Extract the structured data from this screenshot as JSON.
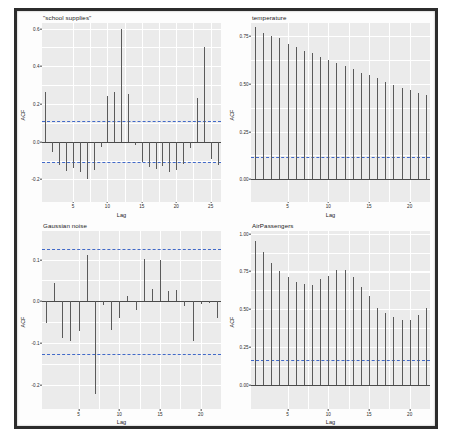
{
  "figure": {
    "layout": "2x2 grid of ACF panels",
    "shared_xlabel": "Lag",
    "shared_ylabel": "ACF",
    "panel_bg": "#ebebeb",
    "gridline_color": "#ffffff",
    "stem_color": "#5a5a5a",
    "ci_color": "#4169c8",
    "frame_color": "#2c2c2c"
  },
  "chart_data": [
    {
      "type": "bar",
      "title": "\"school supplies\"",
      "xlabel": "Lag",
      "ylabel": "ACF",
      "xlim": [
        0.5,
        26.5
      ],
      "ylim": [
        -0.32,
        0.63
      ],
      "yticks": [
        -0.2,
        0.0,
        0.2,
        0.4,
        0.6
      ],
      "ytick_labels": [
        "-0.2",
        "0.0",
        "0.2",
        "0.4",
        "0.6"
      ],
      "xticks": [
        5,
        10,
        15,
        20,
        25
      ],
      "xtick_labels": [
        "5",
        "10",
        "15",
        "20",
        "25"
      ],
      "ci_upper": 0.108,
      "ci_lower": -0.108,
      "grid": true,
      "x": [
        1,
        2,
        3,
        4,
        5,
        6,
        7,
        8,
        9,
        10,
        11,
        12,
        13,
        14,
        15,
        16,
        17,
        18,
        19,
        20,
        21,
        22,
        23,
        24,
        25,
        26
      ],
      "values": [
        0.265,
        -0.055,
        -0.122,
        -0.158,
        -0.14,
        -0.16,
        -0.196,
        -0.15,
        -0.028,
        0.245,
        0.265,
        0.6,
        0.252,
        -0.018,
        -0.11,
        -0.135,
        -0.145,
        -0.128,
        -0.16,
        -0.148,
        -0.12,
        -0.035,
        0.232,
        0.5,
        -0.09,
        -0.125
      ]
    },
    {
      "type": "bar",
      "title": "temperature",
      "xlabel": "Lag",
      "ylabel": "ACF",
      "xlim": [
        0.5,
        22.5
      ],
      "ylim": [
        -0.12,
        0.82
      ],
      "yticks": [
        0.0,
        0.25,
        0.5,
        0.75
      ],
      "ytick_labels": [
        "0.00",
        "0.25",
        "0.50",
        "0.75"
      ],
      "xticks": [
        5,
        10,
        15,
        20
      ],
      "xtick_labels": [
        "5",
        "10",
        "15",
        "20"
      ],
      "ci_upper": 0.118,
      "ci_lower": -0.118,
      "grid": true,
      "x": [
        1,
        2,
        3,
        4,
        5,
        6,
        7,
        8,
        9,
        10,
        11,
        12,
        13,
        14,
        15,
        16,
        17,
        18,
        19,
        20,
        21,
        22
      ],
      "values": [
        0.8,
        0.77,
        0.752,
        0.74,
        0.712,
        0.692,
        0.672,
        0.664,
        0.64,
        0.626,
        0.612,
        0.596,
        0.578,
        0.556,
        0.546,
        0.53,
        0.512,
        0.492,
        0.478,
        0.47,
        0.452,
        0.44
      ]
    },
    {
      "type": "bar",
      "title": "Gaussian noise",
      "xlabel": "Lag",
      "ylabel": "ACF",
      "xlim": [
        0.5,
        22.5
      ],
      "ylim": [
        -0.26,
        0.17
      ],
      "yticks": [
        -0.2,
        -0.1,
        0.0,
        0.1
      ],
      "ytick_labels": [
        "-0.2",
        "-0.1",
        "0.0",
        "0.1"
      ],
      "xticks": [
        5,
        10,
        15,
        20
      ],
      "xtick_labels": [
        "5",
        "10",
        "15",
        "20"
      ],
      "ci_upper": 0.126,
      "ci_lower": -0.126,
      "grid": true,
      "x": [
        1,
        2,
        3,
        4,
        5,
        6,
        7,
        8,
        9,
        10,
        11,
        12,
        13,
        14,
        15,
        16,
        17,
        18,
        19,
        20,
        21,
        22
      ],
      "values": [
        -0.052,
        0.045,
        -0.088,
        -0.096,
        -0.072,
        0.11,
        -0.222,
        -0.01,
        -0.068,
        -0.04,
        0.012,
        -0.022,
        0.102,
        0.03,
        0.1,
        0.024,
        0.026,
        -0.012,
        -0.095,
        -0.006,
        -0.003,
        -0.04
      ]
    },
    {
      "type": "bar",
      "title": "AirPassengers",
      "xlabel": "Lag",
      "ylabel": "ACF",
      "xlim": [
        0.5,
        22.5
      ],
      "ylim": [
        -0.16,
        1.02
      ],
      "yticks": [
        0.0,
        0.25,
        0.5,
        0.75,
        1.0
      ],
      "ytick_labels": [
        "0.00",
        "0.25",
        "0.50",
        "0.75",
        "1.00"
      ],
      "xticks": [
        5,
        10,
        15,
        20
      ],
      "xtick_labels": [
        "5",
        "10",
        "15",
        "20"
      ],
      "ci_upper": 0.164,
      "ci_lower": -0.164,
      "grid": true,
      "x": [
        1,
        2,
        3,
        4,
        5,
        6,
        7,
        8,
        9,
        10,
        11,
        12,
        13,
        14,
        15,
        16,
        17,
        18,
        19,
        20,
        21,
        22
      ],
      "values": [
        0.948,
        0.876,
        0.807,
        0.753,
        0.714,
        0.682,
        0.668,
        0.662,
        0.7,
        0.72,
        0.762,
        0.76,
        0.716,
        0.646,
        0.588,
        0.51,
        0.478,
        0.45,
        0.432,
        0.43,
        0.462,
        0.512
      ]
    }
  ]
}
